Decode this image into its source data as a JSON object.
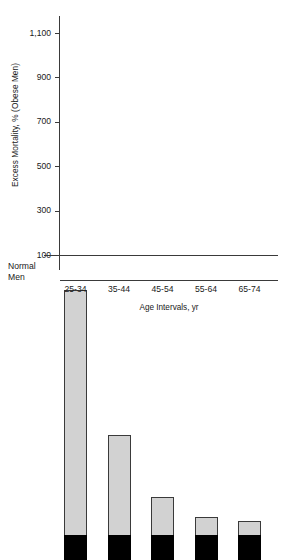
{
  "chart_data": {
    "type": "bar",
    "title": "",
    "subtitle": "",
    "xlabel": "Age Intervals, yr",
    "ylabel": "Excess Mortality, % (Obese Men)",
    "categories": [
      "25-34",
      "35-44",
      "45-54",
      "55-64",
      "65-74"
    ],
    "values": [
      1205,
      550,
      270,
      180,
      165
    ],
    "baseline": 100,
    "baseline_label_lines": [
      "Normal",
      "Men"
    ],
    "ylim": [
      100,
      1205
    ],
    "yticks": [
      100,
      300,
      500,
      700,
      900,
      1100
    ],
    "ytick_labels": [
      "100",
      "300",
      "500",
      "700",
      "900",
      "1,100"
    ],
    "grid": false,
    "legend": false,
    "series": [
      {
        "name": "Excess mortality of obese men",
        "color": "#d2d2d2",
        "values": [
          1205,
          550,
          270,
          180,
          165
        ]
      },
      {
        "name": "Normal men reference",
        "color": "#000000",
        "values": [
          100,
          100,
          100,
          100,
          100
        ]
      }
    ],
    "colors": {
      "bar_fill": "#d2d2d2",
      "bar_outline": "#3a3a3a",
      "reference_block": "#000000",
      "axis": "#3a3a3a",
      "text": "#1a1a1a",
      "background": "#ffffff"
    }
  }
}
